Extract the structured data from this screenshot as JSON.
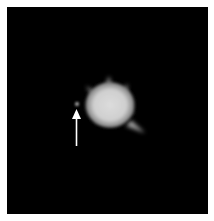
{
  "image": {
    "description": "Fluorescence micrograph on black background showing a bright spiky cell with an arrow pointing to a small adjacent punctum",
    "background_color": "#000000",
    "border_color": "#ffffff",
    "features": [
      {
        "type": "bright-spiky-cell",
        "center": [
          110,
          110
        ],
        "color": "#d8d8d8"
      },
      {
        "type": "small-punctum",
        "center": [
          77,
          104
        ],
        "color": "#9a9a9a"
      },
      {
        "type": "arrow",
        "direction": "up",
        "tip": [
          76,
          109
        ],
        "tail": [
          76,
          145
        ],
        "color": "#ffffff"
      }
    ]
  }
}
